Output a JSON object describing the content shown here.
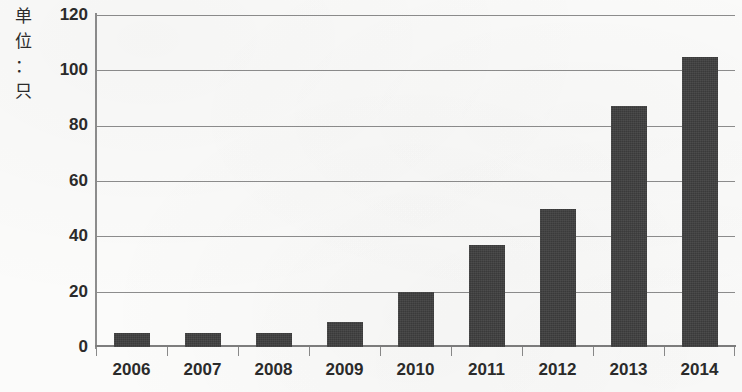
{
  "chart_data": {
    "type": "bar",
    "title": "",
    "subtitle": "",
    "xlabel": "",
    "ylabel": "单位：只",
    "ylabel_chars": [
      "单",
      "位",
      "：",
      "只"
    ],
    "categories": [
      "2006",
      "2007",
      "2008",
      "2009",
      "2010",
      "2011",
      "2012",
      "2013",
      "2014"
    ],
    "values": [
      5,
      5,
      5,
      9,
      20,
      37,
      50,
      87,
      105
    ],
    "ylim": [
      0,
      120
    ],
    "ytick_labels": [
      "0",
      "20",
      "40",
      "60",
      "80",
      "100",
      "120"
    ],
    "ytick_values": [
      0,
      20,
      40,
      60,
      80,
      100,
      120
    ],
    "grid": true,
    "legend": "none",
    "bar_color": "#3b3b3b",
    "grid_color": "#8d8d8d",
    "background_color": "#fbfbfa",
    "text_color": "#2b2b2b"
  }
}
